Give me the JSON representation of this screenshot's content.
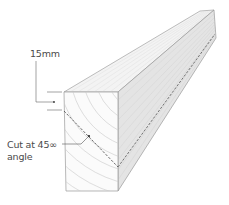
{
  "diagram": {
    "labels": {
      "thickness": "15mm",
      "cut_line1": "Cut at 45∞",
      "cut_line2": "angle"
    },
    "colors": {
      "outline": "#9a9a9a",
      "side_face": "#e2e2e2",
      "top_face": "#f3f3f3",
      "front_face": "#fbfbfb",
      "grain": "#c8c8c8",
      "cut_line": "#444444",
      "leader": "#555555"
    }
  }
}
